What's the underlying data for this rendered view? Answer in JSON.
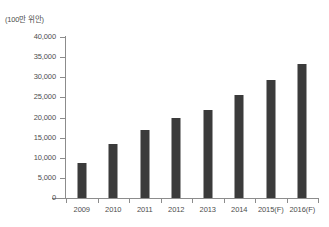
{
  "chart_data": {
    "type": "bar",
    "title": "",
    "subtitle": "",
    "unit_label": "(100만 위안)",
    "xlabel": "",
    "ylabel": "",
    "categories": [
      "2009",
      "2010",
      "2011",
      "2012",
      "2013",
      "2014",
      "2015(F)",
      "2016(F)"
    ],
    "values": [
      8700,
      13300,
      16800,
      19900,
      21800,
      25600,
      29400,
      33200
    ],
    "series": [
      {
        "name": "",
        "values": [
          8700,
          13300,
          16800,
          19900,
          21800,
          25600,
          29400,
          33200
        ]
      }
    ],
    "ylim": [
      0,
      40000
    ],
    "ytick_step": 5000,
    "ytick_labels": [
      "40,000",
      "35,000",
      "30,000",
      "25,000",
      "20,000",
      "15,000",
      "10,000",
      "5,000",
      "0"
    ],
    "ytick_values": [
      40000,
      35000,
      30000,
      25000,
      20000,
      15000,
      10000,
      5000,
      0
    ],
    "grid": false,
    "legend": false,
    "legend_position": "none",
    "bar_color": "#3b3b3b",
    "axis_color": "#8c8c8c",
    "text_color": "#4d4d4d",
    "background_color": "#ffffff"
  }
}
